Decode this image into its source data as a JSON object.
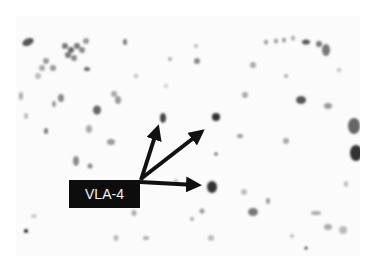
{
  "figure": {
    "type": "immunohistochemistry micrograph",
    "label": "VLA-4",
    "label_color": "#0d0d0d",
    "label_text_color": "#f2f2f2",
    "arrow_color": "#111111",
    "arrow_count": 3,
    "arrows": [
      {
        "target": "upper cell",
        "from": [
          140,
          180
        ],
        "to": [
          162,
          110
        ]
      },
      {
        "target": "upper-right cell",
        "from": [
          140,
          180
        ],
        "to": [
          207,
          124
        ]
      },
      {
        "target": "right cell",
        "from": [
          140,
          182
        ],
        "to": [
          208,
          184
        ]
      }
    ]
  }
}
